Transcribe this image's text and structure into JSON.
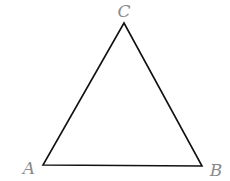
{
  "diagram": {
    "type": "triangle",
    "stroke_color": "#111111",
    "label_color": "#8a8a8a",
    "vertices": {
      "A": {
        "label": "A",
        "x": 43,
        "y": 165,
        "label_x": 29,
        "label_y": 168
      },
      "B": {
        "label": "B",
        "x": 202,
        "y": 166,
        "label_x": 216,
        "label_y": 170
      },
      "C": {
        "label": "C",
        "x": 124,
        "y": 23,
        "label_x": 124,
        "label_y": 11
      }
    }
  }
}
